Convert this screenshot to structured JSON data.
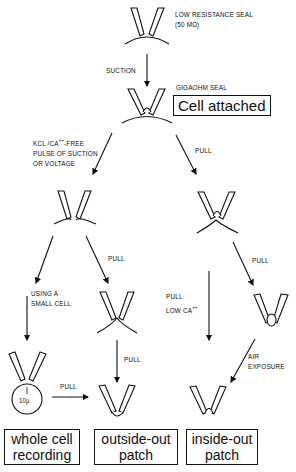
{
  "figure": {
    "stages": {
      "start": {
        "label_line1": "LOW RESISTANCE SEAL",
        "label_line2": "(50 MΩ)"
      },
      "gigaseal": {
        "label": "GIGAOHM SEAL",
        "box": "Cell attached"
      }
    },
    "steps": {
      "suction": "SUCTION",
      "pulse_line1": "KCl /Ca",
      "pulse_sup": "++",
      "pulse_line1_tail": "-FREE",
      "pulse_line2": "PULSE OF SUCTION",
      "pulse_line3": "OR VOLTAGE",
      "pull_right_top": "PULL",
      "pull_mid_left": "PULL",
      "small_cell_line1": "USING A",
      "small_cell_line2": "SMALL CELL",
      "pull_low_ca_line1": "PULL",
      "pull_low_ca_line2": "LOW Ca",
      "pull_low_ca_sup": "++",
      "pull_right_mid": "PULL",
      "pull_to_outside": "PULL",
      "pull_bottom": "PULL",
      "air_line1": "AIR",
      "air_line2": "EXPOSURE"
    },
    "cell_size": "10μ",
    "results": [
      {
        "line1": "whole cell",
        "line2": "recording"
      },
      {
        "line1": "outside-out",
        "line2": "patch"
      },
      {
        "line1": "inside-out",
        "line2": "patch"
      }
    ]
  }
}
